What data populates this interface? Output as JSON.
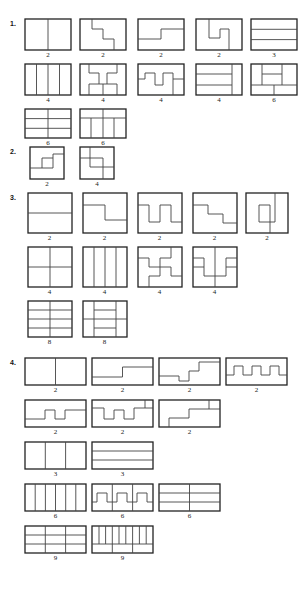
{
  "page": {
    "title": "",
    "background": "#ffffff",
    "stroke_color": "#222222"
  },
  "sections": [
    {
      "number": "1.",
      "shape": "rectangle",
      "rows": [
        {
          "figures": [
            {
              "caption": "2",
              "parts": 2,
              "description": "rectangle split by vertical midline"
            },
            {
              "caption": "2",
              "parts": 2,
              "description": "rectangle split by descending staircase"
            },
            {
              "caption": "2",
              "parts": 2,
              "description": "rectangle split by single offset step"
            },
            {
              "caption": "2",
              "parts": 2,
              "description": "rectangle split by S-shaped zigzag"
            },
            {
              "caption": "3",
              "parts": 3,
              "description": "rectangle split into three horizontal strips"
            }
          ]
        },
        {
          "figures": [
            {
              "caption": "4",
              "parts": 4,
              "description": "rectangle split into four vertical strips"
            },
            {
              "caption": "4",
              "parts": 4,
              "description": "rectangle split into four zigzag pieces"
            },
            {
              "caption": "4",
              "parts": 4,
              "description": "rectangle split into four interlocking steps"
            },
            {
              "caption": "4",
              "parts": 4,
              "description": "rectangle split into three strips plus side column"
            },
            {
              "caption": "6",
              "parts": 6,
              "description": "rectangle split into mixed blocks"
            }
          ]
        },
        {
          "figures": [
            {
              "caption": "6",
              "parts": 6,
              "description": "rectangle split into 2 columns by 3 rows"
            },
            {
              "caption": "6",
              "parts": 6,
              "description": "rectangle split into top strip plus columns"
            }
          ]
        }
      ]
    },
    {
      "number": "2.",
      "shape": "square",
      "rows": [
        {
          "figures": [
            {
              "caption": "2",
              "parts": 2,
              "description": "square split by inner spiral step"
            },
            {
              "caption": "4",
              "parts": 4,
              "description": "square split into four pinwheel pieces"
            }
          ]
        }
      ]
    },
    {
      "number": "3.",
      "shape": "square",
      "rows": [
        {
          "figures": [
            {
              "caption": "2",
              "parts": 2,
              "description": "square split by horizontal midline"
            },
            {
              "caption": "2",
              "parts": 2,
              "description": "square split by single step"
            },
            {
              "caption": "2",
              "parts": 2,
              "description": "square split by double-prong zigzag"
            },
            {
              "caption": "2",
              "parts": 2,
              "description": "square split by staircase"
            },
            {
              "caption": "2",
              "parts": 2,
              "description": "square split by U-shaped cut"
            }
          ]
        },
        {
          "figures": [
            {
              "caption": "4",
              "parts": 4,
              "description": "square split into quadrants"
            },
            {
              "caption": "4",
              "parts": 4,
              "description": "square split into four vertical strips"
            },
            {
              "caption": "4",
              "parts": 4,
              "description": "square split into four pinwheel zigzags"
            },
            {
              "caption": "4",
              "parts": 4,
              "description": "square split into four interlocking U pieces"
            }
          ]
        },
        {
          "figures": [
            {
              "caption": "8",
              "parts": 8,
              "description": "square split into 2 columns by 4 rows"
            },
            {
              "caption": "8",
              "parts": 8,
              "description": "square split into mixed eight pieces"
            }
          ]
        }
      ]
    },
    {
      "number": "4.",
      "shape": "wide-rectangle",
      "rows": [
        {
          "figures": [
            {
              "caption": "2",
              "parts": 2,
              "description": "wide rectangle split by vertical midline"
            },
            {
              "caption": "2",
              "parts": 2,
              "description": "wide rectangle split by single step"
            },
            {
              "caption": "2",
              "parts": 2,
              "description": "wide rectangle split by ascending staircase"
            },
            {
              "caption": "2",
              "parts": 2,
              "description": "wide rectangle split by square-wave comb"
            }
          ]
        },
        {
          "figures": [
            {
              "caption": "2",
              "parts": 2,
              "description": "wide rectangle split by shallow square wave"
            },
            {
              "caption": "2",
              "parts": 2,
              "description": "wide rectangle split by deep square wave"
            },
            {
              "caption": "2",
              "parts": 2,
              "description": "wide rectangle split by two-step staircase"
            }
          ]
        },
        {
          "figures": [
            {
              "caption": "3",
              "parts": 3,
              "description": "wide rectangle split into three vertical strips"
            },
            {
              "caption": "3",
              "parts": 3,
              "description": "wide rectangle split into three horizontal strips"
            }
          ]
        },
        {
          "figures": [
            {
              "caption": "6",
              "parts": 6,
              "description": "wide rectangle split into six vertical strips"
            },
            {
              "caption": "6",
              "parts": 6,
              "description": "wide rectangle split into six zigzag pieces"
            },
            {
              "caption": "6",
              "parts": 6,
              "description": "wide rectangle split into 2 columns by 3 rows"
            }
          ]
        },
        {
          "figures": [
            {
              "caption": "9",
              "parts": 9,
              "description": "wide rectangle split into 3 columns by 3 rows"
            },
            {
              "caption": "9",
              "parts": 9,
              "description": "wide rectangle split into mixed nine pieces"
            }
          ]
        }
      ]
    }
  ]
}
